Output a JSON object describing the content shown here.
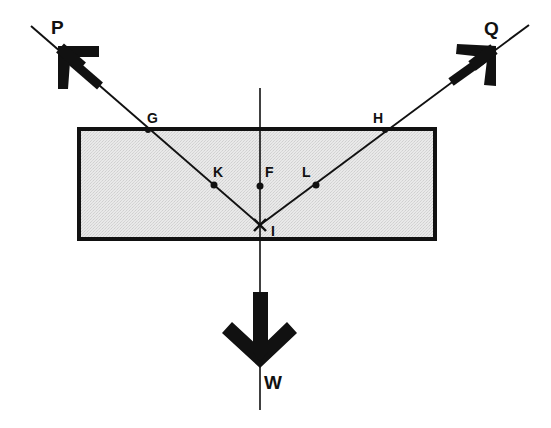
{
  "diagram": {
    "title": "",
    "block": {
      "fill": "#e6e6e6",
      "stroke": "#111111"
    },
    "labels": {
      "P": "P",
      "Q": "Q",
      "G": "G",
      "H": "H",
      "K": "K",
      "F": "F",
      "L": "L",
      "I": "I",
      "W": "W"
    },
    "forces": [
      {
        "name": "P",
        "direction": "up-left",
        "from_point": "I",
        "through_point": "G"
      },
      {
        "name": "Q",
        "direction": "up-right",
        "from_point": "I",
        "through_point": "H"
      },
      {
        "name": "W",
        "direction": "down",
        "from_point": "I"
      }
    ],
    "points": [
      "G",
      "H",
      "K",
      "F",
      "L",
      "I"
    ],
    "colors": {
      "ink": "#111111",
      "background": "#ffffff",
      "block_fill": "#e6e6e6"
    }
  }
}
